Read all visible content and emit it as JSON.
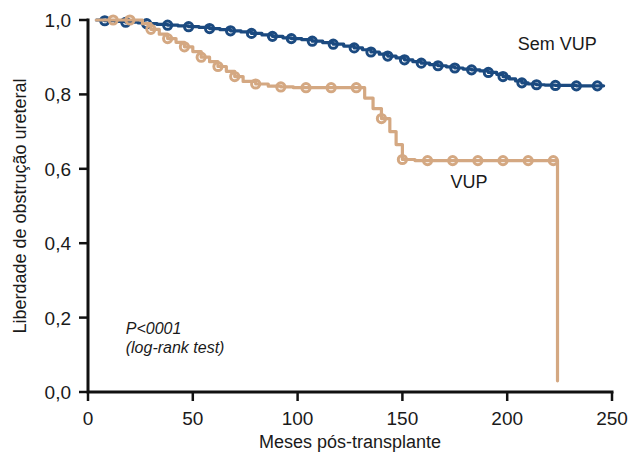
{
  "chart_data": {
    "type": "line",
    "title": "",
    "subtitle": "",
    "xlabel": "Meses pós-transplante",
    "ylabel": "Liberdade de obstrução ureteral",
    "xlim": [
      0,
      250
    ],
    "ylim": [
      0.0,
      1.0
    ],
    "grid": false,
    "legend_position": "inline-right",
    "xticks": [
      0,
      50,
      100,
      150,
      200,
      250
    ],
    "xtick_labels": [
      "0",
      "50",
      "100",
      "150",
      "200",
      "250"
    ],
    "yticks": [
      0.0,
      0.2,
      0.4,
      0.6,
      0.8,
      1.0
    ],
    "ytick_labels": [
      "0,0",
      "0,2",
      "0,4",
      "0,6",
      "0,8",
      "1,0"
    ],
    "annotations": [
      {
        "name": "p-value",
        "text": "P<0001",
        "x": 18,
        "y": 0.155
      },
      {
        "name": "test-name",
        "text": "(log-rank test)",
        "x": 18,
        "y": 0.105
      }
    ],
    "series": [
      {
        "name": "Sem VUP",
        "label": "Sem VUP",
        "color": "#1b4a80",
        "label_x": 205,
        "label_y": 0.935,
        "points": [
          [
            4,
            1.0
          ],
          [
            8,
            0.998
          ],
          [
            13,
            0.996
          ],
          [
            18,
            0.994
          ],
          [
            24,
            0.992
          ],
          [
            28,
            0.99
          ],
          [
            33,
            0.988
          ],
          [
            38,
            0.986
          ],
          [
            43,
            0.984
          ],
          [
            48,
            0.982
          ],
          [
            53,
            0.98
          ],
          [
            58,
            0.977
          ],
          [
            63,
            0.974
          ],
          [
            68,
            0.971
          ],
          [
            73,
            0.968
          ],
          [
            78,
            0.964
          ],
          [
            83,
            0.96
          ],
          [
            88,
            0.956
          ],
          [
            93,
            0.952
          ],
          [
            97,
            0.95
          ],
          [
            102,
            0.947
          ],
          [
            107,
            0.943
          ],
          [
            112,
            0.939
          ],
          [
            117,
            0.935
          ],
          [
            122,
            0.93
          ],
          [
            127,
            0.925
          ],
          [
            131,
            0.92
          ],
          [
            135,
            0.914
          ],
          [
            139,
            0.908
          ],
          [
            143,
            0.903
          ],
          [
            147,
            0.898
          ],
          [
            151,
            0.893
          ],
          [
            155,
            0.888
          ],
          [
            159,
            0.884
          ],
          [
            163,
            0.88
          ],
          [
            167,
            0.877
          ],
          [
            171,
            0.874
          ],
          [
            175,
            0.871
          ],
          [
            179,
            0.868
          ],
          [
            183,
            0.866
          ],
          [
            187,
            0.863
          ],
          [
            191,
            0.859
          ],
          [
            195,
            0.854
          ],
          [
            198,
            0.848
          ],
          [
            201,
            0.842
          ],
          [
            204,
            0.836
          ],
          [
            207,
            0.831
          ],
          [
            210,
            0.828
          ],
          [
            214,
            0.826
          ],
          [
            218,
            0.825
          ],
          [
            223,
            0.824
          ],
          [
            228,
            0.824
          ],
          [
            233,
            0.823
          ],
          [
            238,
            0.823
          ],
          [
            243,
            0.823
          ],
          [
            246,
            0.823
          ]
        ],
        "censor_marks": [
          [
            8,
            0.998
          ],
          [
            18,
            0.994
          ],
          [
            28,
            0.99
          ],
          [
            38,
            0.986
          ],
          [
            48,
            0.982
          ],
          [
            58,
            0.977
          ],
          [
            68,
            0.971
          ],
          [
            78,
            0.964
          ],
          [
            88,
            0.956
          ],
          [
            97,
            0.95
          ],
          [
            107,
            0.943
          ],
          [
            117,
            0.935
          ],
          [
            127,
            0.925
          ],
          [
            135,
            0.914
          ],
          [
            143,
            0.903
          ],
          [
            151,
            0.893
          ],
          [
            159,
            0.884
          ],
          [
            167,
            0.877
          ],
          [
            175,
            0.871
          ],
          [
            183,
            0.866
          ],
          [
            191,
            0.859
          ],
          [
            198,
            0.848
          ],
          [
            207,
            0.831
          ],
          [
            214,
            0.826
          ],
          [
            223,
            0.824
          ],
          [
            233,
            0.823
          ],
          [
            243,
            0.823
          ]
        ]
      },
      {
        "name": "VUP",
        "label": "VUP",
        "color": "#d4a882",
        "label_x": 173,
        "label_y": 0.565,
        "points": [
          [
            4,
            1.0
          ],
          [
            12,
            1.0
          ],
          [
            20,
            1.0
          ],
          [
            26,
            0.99
          ],
          [
            30,
            0.975
          ],
          [
            34,
            0.962
          ],
          [
            38,
            0.95
          ],
          [
            42,
            0.94
          ],
          [
            46,
            0.928
          ],
          [
            50,
            0.915
          ],
          [
            54,
            0.9
          ],
          [
            58,
            0.888
          ],
          [
            62,
            0.875
          ],
          [
            66,
            0.862
          ],
          [
            70,
            0.848
          ],
          [
            74,
            0.835
          ],
          [
            80,
            0.828
          ],
          [
            86,
            0.822
          ],
          [
            92,
            0.82
          ],
          [
            98,
            0.818
          ],
          [
            104,
            0.818
          ],
          [
            110,
            0.818
          ],
          [
            116,
            0.818
          ],
          [
            122,
            0.818
          ],
          [
            128,
            0.818
          ],
          [
            132,
            0.79
          ],
          [
            136,
            0.762
          ],
          [
            140,
            0.735
          ],
          [
            144,
            0.7
          ],
          [
            147,
            0.665
          ],
          [
            150,
            0.625
          ],
          [
            156,
            0.622
          ],
          [
            162,
            0.622
          ],
          [
            168,
            0.622
          ],
          [
            174,
            0.622
          ],
          [
            180,
            0.622
          ],
          [
            186,
            0.622
          ],
          [
            192,
            0.622
          ],
          [
            198,
            0.622
          ],
          [
            204,
            0.622
          ],
          [
            210,
            0.622
          ],
          [
            216,
            0.622
          ],
          [
            222,
            0.622
          ],
          [
            224,
            0.622
          ],
          [
            224,
            0.03
          ]
        ],
        "censor_marks": [
          [
            12,
            1.0
          ],
          [
            20,
            1.0
          ],
          [
            30,
            0.975
          ],
          [
            38,
            0.95
          ],
          [
            46,
            0.928
          ],
          [
            54,
            0.9
          ],
          [
            62,
            0.875
          ],
          [
            70,
            0.848
          ],
          [
            80,
            0.828
          ],
          [
            92,
            0.82
          ],
          [
            104,
            0.818
          ],
          [
            116,
            0.818
          ],
          [
            128,
            0.818
          ],
          [
            140,
            0.735
          ],
          [
            150,
            0.625
          ],
          [
            162,
            0.622
          ],
          [
            174,
            0.622
          ],
          [
            186,
            0.622
          ],
          [
            198,
            0.622
          ],
          [
            210,
            0.622
          ],
          [
            222,
            0.622
          ]
        ]
      }
    ]
  }
}
